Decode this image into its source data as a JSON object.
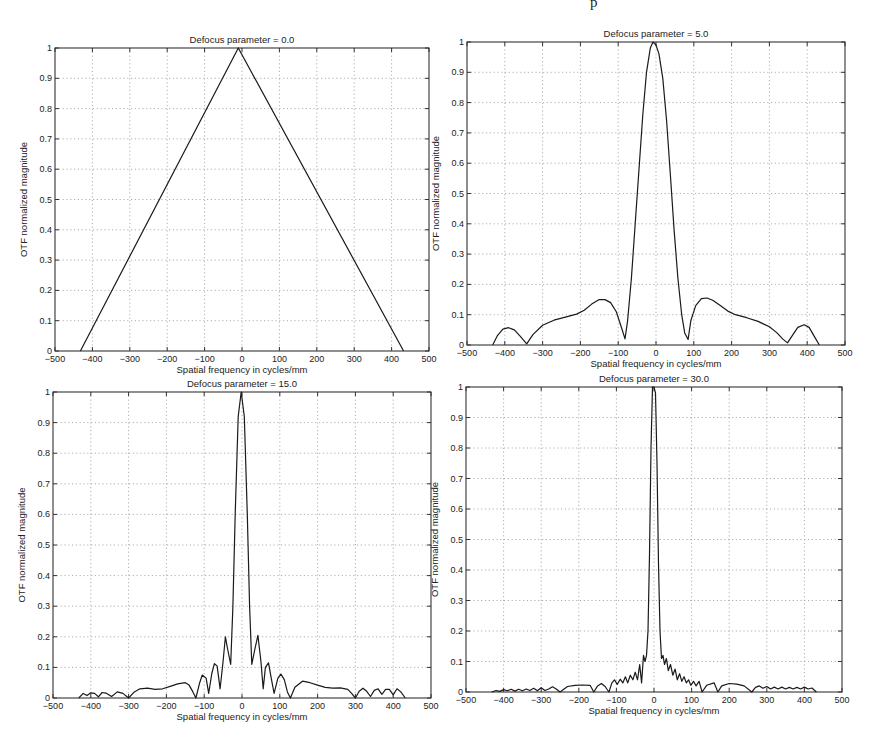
{
  "page_header_fragment": "p",
  "chart_data": [
    {
      "type": "line",
      "title": "Defocus parameter = 0.0",
      "xlabel": "Spatial frequency in cycles/mm",
      "ylabel": "OTF normalized magnitude",
      "xlim": [
        -500,
        500
      ],
      "ylim": [
        0,
        1
      ],
      "xticks": [
        -500,
        -400,
        -300,
        -200,
        -100,
        0,
        100,
        200,
        300,
        400,
        500
      ],
      "yticks": [
        0,
        0.1,
        0.2,
        0.3,
        0.4,
        0.5,
        0.6,
        0.7,
        0.8,
        0.9,
        1
      ],
      "ytick_labels": [
        "0",
        "0.1",
        "0.2",
        "0.3",
        "0.4",
        "0.5",
        "0.6",
        "0.7",
        "0.8",
        "0.9",
        "1"
      ],
      "grid": true,
      "box": {
        "left": 55,
        "top": 48,
        "right": 429,
        "bottom": 351
      },
      "series": [
        {
          "name": "OTF",
          "x": [
            -432,
            -10,
            432
          ],
          "y": [
            0,
            1,
            0
          ]
        }
      ]
    },
    {
      "type": "line",
      "title": "Defocus parameter = 5.0",
      "xlabel": "Spatial frequency in cycles/mm",
      "ylabel": "OTF normalized magnitude",
      "xlim": [
        -500,
        500
      ],
      "ylim": [
        0,
        1
      ],
      "xticks": [
        -500,
        -400,
        -300,
        -200,
        -100,
        0,
        100,
        200,
        300,
        400,
        500
      ],
      "yticks": [
        0,
        0.1,
        0.2,
        0.3,
        0.4,
        0.5,
        0.6,
        0.7,
        0.8,
        0.9,
        1
      ],
      "ytick_labels": [
        "0",
        "0.1",
        "0.2",
        "0.3",
        "0.4",
        "0.5",
        "0.6",
        "0.7",
        "0.8",
        "0.9",
        "1"
      ],
      "grid": true,
      "box": {
        "left": 467,
        "top": 42,
        "right": 845,
        "bottom": 345
      },
      "series": [
        {
          "name": "OTF",
          "x": [
            -432,
            -420,
            -405,
            -390,
            -375,
            -360,
            -342,
            -325,
            -300,
            -270,
            -240,
            -210,
            -190,
            -170,
            -150,
            -135,
            -120,
            -105,
            -92,
            -82,
            -75,
            -65,
            -55,
            -45,
            -35,
            -25,
            -15,
            -8,
            0,
            8,
            18,
            28,
            38,
            48,
            58,
            68,
            76,
            85,
            92,
            105,
            120,
            135,
            150,
            170,
            190,
            210,
            240,
            270,
            300,
            320,
            335,
            348,
            360,
            375,
            392,
            405,
            418,
            432
          ],
          "y": [
            0,
            0.03,
            0.052,
            0.057,
            0.05,
            0.03,
            0.004,
            0.035,
            0.065,
            0.082,
            0.092,
            0.102,
            0.115,
            0.135,
            0.15,
            0.15,
            0.14,
            0.11,
            0.06,
            0.02,
            0.08,
            0.22,
            0.4,
            0.58,
            0.76,
            0.9,
            0.98,
            1.0,
            0.99,
            0.96,
            0.88,
            0.74,
            0.56,
            0.38,
            0.22,
            0.1,
            0.04,
            0.018,
            0.08,
            0.13,
            0.153,
            0.155,
            0.148,
            0.13,
            0.112,
            0.1,
            0.09,
            0.078,
            0.06,
            0.04,
            0.02,
            0.007,
            0.03,
            0.058,
            0.067,
            0.058,
            0.03,
            0.0
          ]
        }
      ]
    },
    {
      "type": "line",
      "title": "Defocus parameter = 15.0",
      "xlabel": "Spatial frequency in cycles/mm",
      "ylabel": "OTF normalized magnitude",
      "xlim": [
        -500,
        500
      ],
      "ylim": [
        0,
        1
      ],
      "xticks": [
        -500,
        -400,
        -300,
        -200,
        -100,
        0,
        100,
        200,
        300,
        400,
        500
      ],
      "yticks": [
        0,
        0.1,
        0.2,
        0.3,
        0.4,
        0.5,
        0.6,
        0.7,
        0.8,
        0.9,
        1
      ],
      "ytick_labels": [
        "0",
        "0.1",
        "0.2",
        "0.3",
        "0.4",
        "0.5",
        "0.6",
        "0.7",
        "0.8",
        "0.9",
        "1"
      ],
      "grid": true,
      "box": {
        "left": 53,
        "top": 392,
        "right": 431,
        "bottom": 698
      },
      "series": [
        {
          "name": "OTF",
          "x": [
            -432,
            -420,
            -410,
            -400,
            -390,
            -380,
            -370,
            -360,
            -345,
            -330,
            -315,
            -300,
            -285,
            -270,
            -250,
            -230,
            -210,
            -190,
            -170,
            -150,
            -140,
            -130,
            -122,
            -112,
            -105,
            -95,
            -88,
            -80,
            -73,
            -66,
            -58,
            -50,
            -44,
            -38,
            -30,
            -24,
            -18,
            -10,
            -2,
            6,
            14,
            20,
            26,
            34,
            42,
            50,
            56,
            62,
            70,
            78,
            85,
            95,
            103,
            112,
            120,
            128,
            140,
            160,
            180,
            200,
            220,
            240,
            260,
            280,
            290,
            300,
            310,
            320,
            330,
            340,
            350,
            360,
            370,
            380,
            390,
            400,
            410,
            420,
            432
          ],
          "y": [
            0,
            0.015,
            0.008,
            0.017,
            0.015,
            0.004,
            0.018,
            0.016,
            0.005,
            0.02,
            0.015,
            0.0,
            0.02,
            0.03,
            0.032,
            0.028,
            0.03,
            0.038,
            0.046,
            0.05,
            0.042,
            0.02,
            0.0,
            0.05,
            0.075,
            0.065,
            0.015,
            0.08,
            0.112,
            0.105,
            0.03,
            0.12,
            0.2,
            0.16,
            0.11,
            0.3,
            0.6,
            0.92,
            1.0,
            0.92,
            0.6,
            0.3,
            0.11,
            0.16,
            0.205,
            0.12,
            0.03,
            0.1,
            0.115,
            0.06,
            0.015,
            0.065,
            0.078,
            0.06,
            0.02,
            0.0,
            0.035,
            0.055,
            0.05,
            0.042,
            0.035,
            0.032,
            0.033,
            0.028,
            0.015,
            0.0,
            0.022,
            0.032,
            0.022,
            0.005,
            0.025,
            0.03,
            0.012,
            0.028,
            0.028,
            0.01,
            0.03,
            0.02,
            0.0
          ]
        }
      ]
    },
    {
      "type": "line",
      "title": "Defocus parameter = 30.0",
      "xlabel": "Spatial frequency in cycles/mm",
      "ylabel": "OTF normalized magnitude",
      "xlim": [
        -500,
        500
      ],
      "ylim": [
        0,
        1
      ],
      "xticks": [
        -500,
        -400,
        -300,
        -200,
        -100,
        0,
        100,
        200,
        300,
        400,
        500
      ],
      "yticks": [
        0,
        0.1,
        0.2,
        0.3,
        0.4,
        0.5,
        0.6,
        0.7,
        0.8,
        0.9,
        1
      ],
      "ytick_labels": [
        "0",
        "0.1",
        "0.2",
        "0.3",
        "0.4",
        "0.5",
        "0.6",
        "0.7",
        "0.8",
        "0.9",
        "1"
      ],
      "grid": true,
      "box": {
        "left": 466,
        "top": 387,
        "right": 842,
        "bottom": 692
      },
      "series": [
        {
          "name": "OTF",
          "x": [
            -432,
            -420,
            -410,
            -400,
            -390,
            -380,
            -370,
            -360,
            -350,
            -340,
            -330,
            -320,
            -310,
            -300,
            -290,
            -280,
            -270,
            -260,
            -250,
            -230,
            -210,
            -190,
            -170,
            -160,
            -150,
            -140,
            -130,
            -120,
            -112,
            -105,
            -98,
            -90,
            -83,
            -76,
            -70,
            -63,
            -56,
            -50,
            -44,
            -38,
            -33,
            -28,
            -24,
            -20,
            -16,
            -12,
            -8,
            -4,
            0,
            4,
            8,
            12,
            16,
            20,
            24,
            28,
            33,
            38,
            44,
            50,
            56,
            62,
            68,
            74,
            80,
            86,
            92,
            98,
            105,
            112,
            120,
            128,
            140,
            160,
            170,
            180,
            200,
            220,
            240,
            260,
            270,
            280,
            290,
            300,
            310,
            320,
            330,
            340,
            350,
            360,
            370,
            380,
            390,
            400,
            410,
            420,
            432
          ],
          "y": [
            0,
            0.005,
            0.002,
            0.008,
            0.004,
            0.009,
            0.003,
            0.009,
            0.004,
            0.01,
            0.005,
            0.012,
            0.004,
            0.014,
            0.005,
            0.01,
            0.017,
            0.01,
            0.0,
            0.018,
            0.022,
            0.023,
            0.022,
            0.0,
            0.02,
            0.028,
            0.018,
            0.0,
            0.03,
            0.04,
            0.025,
            0.042,
            0.03,
            0.05,
            0.03,
            0.055,
            0.04,
            0.065,
            0.04,
            0.09,
            0.03,
            0.12,
            0.1,
            0.12,
            0.2,
            0.45,
            0.8,
            1.0,
            1.0,
            0.98,
            0.75,
            0.42,
            0.2,
            0.11,
            0.12,
            0.09,
            0.11,
            0.07,
            0.09,
            0.055,
            0.075,
            0.04,
            0.06,
            0.035,
            0.05,
            0.03,
            0.04,
            0.022,
            0.035,
            0.02,
            0.035,
            0.0,
            0.022,
            0.03,
            0.0,
            0.02,
            0.028,
            0.026,
            0.02,
            0.0,
            0.015,
            0.02,
            0.012,
            0.018,
            0.01,
            0.016,
            0.01,
            0.016,
            0.01,
            0.015,
            0.01,
            0.015,
            0.01,
            0.016,
            0.01,
            0.013,
            0.0
          ]
        }
      ]
    }
  ]
}
